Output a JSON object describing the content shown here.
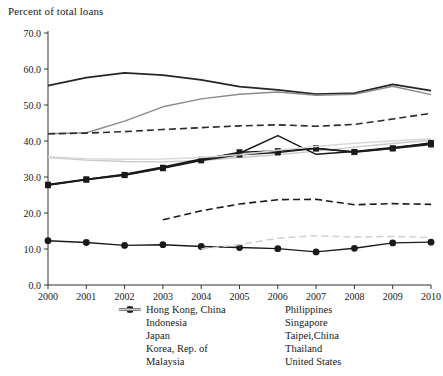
{
  "chart_data": {
    "type": "line",
    "title": "Percent of total loans",
    "xlabel": "",
    "ylabel": "Percent of total loans",
    "ylim": [
      0.0,
      70.0
    ],
    "ytick_step": 10.0,
    "ytick_labels": [
      "0.0",
      "10.0",
      "20.0",
      "30.0",
      "40.0",
      "50.0",
      "60.0",
      "70.0"
    ],
    "grid": false,
    "legend_position": "bottom",
    "x": [
      2000,
      2001,
      2002,
      2003,
      2004,
      2005,
      2006,
      2007,
      2008,
      2009,
      2010
    ],
    "xtick_labels": [
      "2000",
      "2001",
      "2002",
      "2003",
      "2004",
      "2005",
      "2006",
      "2007",
      "2008",
      "2009",
      "2010"
    ],
    "series": [
      {
        "name": "Hong Kong, China",
        "color": "#262626",
        "style": "solid",
        "width": 1.8,
        "marker": "none",
        "values": [
          55.4,
          57.6,
          58.9,
          58.3,
          57.0,
          55.1,
          54.2,
          53.0,
          53.3,
          55.7,
          54.0
        ]
      },
      {
        "name": "Indonesia",
        "color": "#c9c9c9",
        "style": "solid",
        "width": 1.4,
        "marker": "none",
        "values": [
          35.4,
          34.7,
          34.3,
          34.2,
          34.6,
          35.4,
          36.2,
          37.2,
          38.3,
          39.3,
          40.2
        ]
      },
      {
        "name": "Japan",
        "color": "#1a1a1a",
        "style": "solid",
        "width": 1.5,
        "marker": "square",
        "values": [
          27.9,
          29.4,
          30.6,
          32.6,
          34.8,
          36.9,
          37.2,
          37.9,
          37.0,
          38.0,
          39.5
        ]
      },
      {
        "name": "Korea, Rep. of",
        "color": "#1a1a1a",
        "style": "solid",
        "width": 1.5,
        "marker": "none",
        "values": [
          27.8,
          29.3,
          30.8,
          32.8,
          35.0,
          36.6,
          41.5,
          36.3,
          37.1,
          38.2,
          39.3
        ]
      },
      {
        "name": "Malaysia",
        "color": "#1a1a1a",
        "style": "solid",
        "width": 1.5,
        "marker": "square",
        "values": [
          27.7,
          29.2,
          30.5,
          32.4,
          34.6,
          36.2,
          36.8,
          38.0,
          36.9,
          37.9,
          39.0
        ]
      },
      {
        "name": "Philippines",
        "color": "#1a1a1a",
        "style": "solid",
        "width": 1.4,
        "marker": "circle",
        "values": [
          12.3,
          11.8,
          11.0,
          11.2,
          10.7,
          10.4,
          10.1,
          9.2,
          10.2,
          11.7,
          11.9
        ]
      },
      {
        "name": "Singapore",
        "color": "#8a8a8a",
        "style": "solid",
        "width": 1.4,
        "marker": "none",
        "values": [
          42.0,
          42.3,
          45.5,
          49.5,
          51.7,
          53.0,
          53.6,
          52.7,
          53.0,
          55.2,
          52.9
        ]
      },
      {
        "name": "Taipei,China",
        "color": "#d8d8d8",
        "style": "solid",
        "width": 1.5,
        "marker": "none",
        "values": [
          35.6,
          35.1,
          34.9,
          35.0,
          35.4,
          36.2,
          37.4,
          38.5,
          39.4,
          40.0,
          40.6
        ]
      },
      {
        "name": "Thailand",
        "color": "#1a1a1a",
        "style": "dashed",
        "width": 1.6,
        "marker": "none",
        "values": [
          null,
          null,
          null,
          18.1,
          20.6,
          22.5,
          23.7,
          23.8,
          22.3,
          22.6,
          22.4
        ]
      },
      {
        "name": "United States",
        "color": "#d0d0d0",
        "style": "dashed",
        "width": 1.5,
        "marker": "none",
        "values": [
          null,
          null,
          null,
          null,
          10.0,
          11.2,
          13.0,
          13.7,
          13.3,
          13.5,
          13.2
        ]
      },
      {
        "name": "Thailand-upper-segment",
        "color": "#2b2b2b",
        "style": "dashed",
        "width": 1.6,
        "marker": "none",
        "hidden_from_legend": true,
        "values": [
          42.0,
          42.2,
          42.6,
          43.2,
          43.7,
          44.2,
          44.5,
          44.1,
          44.6,
          46.1,
          47.7
        ]
      }
    ]
  },
  "legend": {
    "columns": [
      [
        {
          "label": "Hong Kong, China",
          "swatch": "solid-dark-thick"
        },
        {
          "label": "Indonesia",
          "swatch": "solid-light"
        },
        {
          "label": "Japan",
          "swatch": "solid-dark-square"
        },
        {
          "label": "Korea, Rep. of",
          "swatch": "solid-dark"
        },
        {
          "label": "Malaysia",
          "swatch": "solid-dark-square"
        }
      ],
      [
        {
          "label": "Philippines",
          "swatch": "solid-dark-circle"
        },
        {
          "label": "Singapore",
          "swatch": "solid-gray"
        },
        {
          "label": "Taipei,China",
          "swatch": "solid-lightest"
        },
        {
          "label": "Thailand",
          "swatch": "dashed-dark"
        },
        {
          "label": "United States",
          "swatch": "solid-light2"
        }
      ]
    ]
  }
}
